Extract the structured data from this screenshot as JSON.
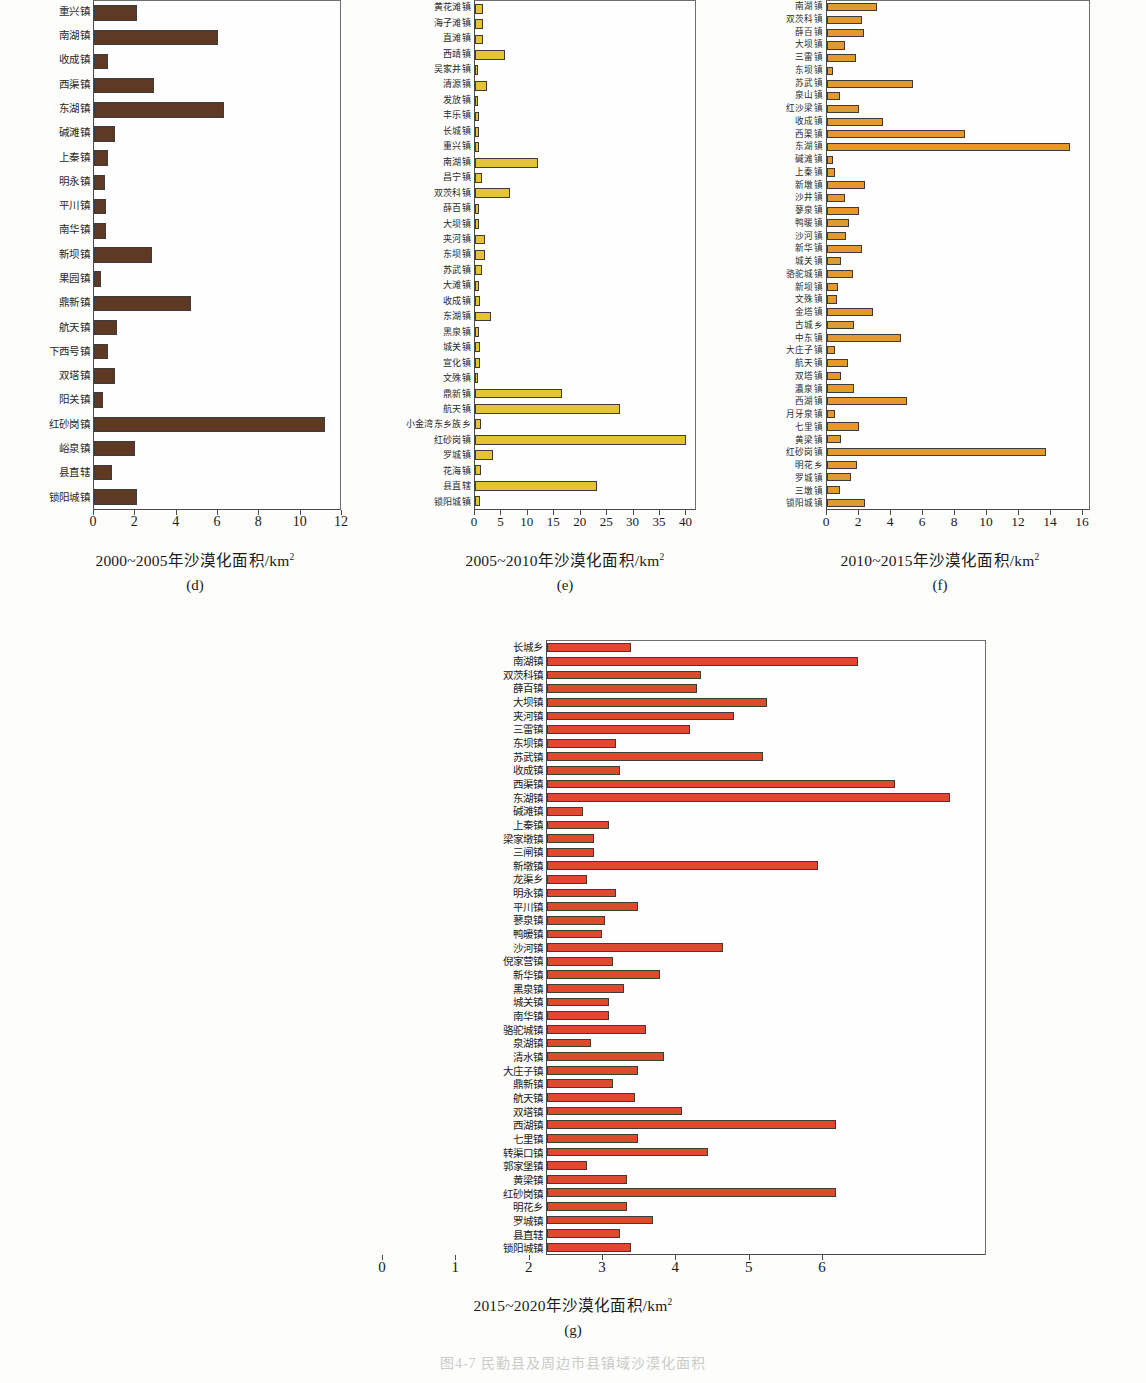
{
  "figure": {
    "bottom_caption": "图4-7 民勤县及周边市县镇域沙漠化面积"
  },
  "chart_data": [
    {
      "id": "d",
      "type": "bar",
      "orientation": "horizontal",
      "title": "",
      "xlabel": "2000~2005年沙漠化面积/km",
      "xlabel_sup": "2",
      "panel_label": "(d)",
      "ylabel": "",
      "xlim": [
        0,
        12
      ],
      "xticks": [
        0,
        2,
        4,
        6,
        8,
        10,
        12
      ],
      "grid": false,
      "color": "#5e3a25",
      "categories": [
        "重兴镇",
        "南湖镇",
        "收成镇",
        "西渠镇",
        "东湖镇",
        "碱滩镇",
        "上秦镇",
        "明永镇",
        "平川镇",
        "南华镇",
        "新坝镇",
        "果园镇",
        "鼎新镇",
        "航天镇",
        "下西号镇",
        "双塔镇",
        "阳关镇",
        "红砂岗镇",
        "峪泉镇",
        "县直辖",
        "锁阳城镇"
      ],
      "values": [
        2.1,
        6.0,
        0.7,
        2.9,
        6.3,
        1.0,
        0.7,
        0.55,
        0.6,
        0.6,
        2.8,
        0.35,
        4.7,
        1.1,
        0.7,
        1.0,
        0.45,
        11.2,
        2.0,
        0.85,
        2.1
      ]
    },
    {
      "id": "e",
      "type": "bar",
      "orientation": "horizontal",
      "title": "",
      "xlabel": "2005~2010年沙漠化面积/km",
      "xlabel_sup": "2",
      "panel_label": "(e)",
      "ylabel": "",
      "xlim": [
        0,
        42
      ],
      "xticks": [
        0,
        5,
        10,
        15,
        20,
        25,
        30,
        35,
        40
      ],
      "grid": false,
      "color": "#e5c433",
      "categories": [
        "黄花滩镇",
        "海子滩镇",
        "直滩镇",
        "西靖镇",
        "吴家井镇",
        "清源镇",
        "发放镇",
        "丰乐镇",
        "长城镇",
        "重兴镇",
        "南湖镇",
        "昌宁镇",
        "双茨科镇",
        "薛百镇",
        "大坝镇",
        "夹河镇",
        "东坝镇",
        "苏武镇",
        "大滩镇",
        "收成镇",
        "东湖镇",
        "黑泉镇",
        "城关镇",
        "宣化镇",
        "文殊镇",
        "鼎新镇",
        "航天镇",
        "小金湾东乡族乡",
        "红砂岗镇",
        "罗城镇",
        "花海镇",
        "县直辖",
        "锁阳城镇"
      ],
      "values": [
        1.6,
        1.6,
        1.6,
        5.6,
        0.5,
        2.3,
        0.6,
        0.7,
        0.7,
        0.7,
        12.0,
        1.4,
        6.6,
        0.7,
        0.8,
        1.9,
        1.9,
        1.3,
        0.7,
        1.0,
        3.0,
        0.8,
        1.0,
        1.0,
        0.5,
        16.5,
        27.5,
        1.1,
        40.0,
        3.4,
        1.2,
        23.0,
        0.9
      ]
    },
    {
      "id": "f",
      "type": "bar",
      "orientation": "horizontal",
      "title": "",
      "xlabel": "2010~2015年沙漠化面积/km",
      "xlabel_sup": "2",
      "panel_label": "(f)",
      "ylabel": "",
      "xlim": [
        0,
        16.5
      ],
      "xticks": [
        0,
        2,
        4,
        6,
        8,
        10,
        12,
        14,
        16
      ],
      "grid": false,
      "color": "#e3992e",
      "categories": [
        "南湖镇",
        "双茨科镇",
        "薛百镇",
        "大坝镇",
        "三雷镇",
        "东坝镇",
        "苏武镇",
        "泉山镇",
        "红沙梁镇",
        "收成镇",
        "西渠镇",
        "东湖镇",
        "碱滩镇",
        "上秦镇",
        "新墩镇",
        "沙井镇",
        "蓼泉镇",
        "鸭暖镇",
        "沙河镇",
        "新华镇",
        "城关镇",
        "骆驼城镇",
        "新坝镇",
        "文殊镇",
        "金塔镇",
        "古城乡",
        "中东镇",
        "大庄子镇",
        "航天镇",
        "双塔镇",
        "瀛泉镇",
        "西湖镇",
        "月牙泉镇",
        "七里镇",
        "黄梁镇",
        "红砂岗镇",
        "明花乡",
        "罗城镇",
        "三墩镇",
        "锁阳城镇"
      ],
      "values": [
        3.1,
        2.2,
        2.3,
        1.1,
        1.8,
        0.4,
        5.4,
        0.8,
        2.0,
        3.5,
        8.6,
        15.2,
        0.4,
        0.5,
        2.4,
        1.1,
        2.0,
        1.4,
        1.2,
        2.2,
        0.9,
        1.6,
        0.7,
        0.6,
        2.9,
        1.7,
        4.6,
        0.5,
        1.3,
        0.9,
        1.7,
        5.0,
        0.5,
        2.0,
        0.9,
        13.7,
        1.9,
        1.5,
        0.8,
        2.4
      ]
    },
    {
      "id": "g",
      "type": "bar",
      "orientation": "horizontal",
      "title": "",
      "xlabel": "2015~2020年沙漠化面积/km",
      "xlabel_sup": "2",
      "panel_label": "(g)",
      "ylabel": "",
      "xlim": [
        0,
        6
      ],
      "xticks": [
        0,
        1,
        2,
        3,
        4,
        5,
        6
      ],
      "grid": false,
      "color": "#df4a2c",
      "categories": [
        "长城乡",
        "南湖镇",
        "双茨科镇",
        "薛百镇",
        "大坝镇",
        "夹河镇",
        "三雷镇",
        "东坝镇",
        "苏武镇",
        "收成镇",
        "西渠镇",
        "东湖镇",
        "碱滩镇",
        "上秦镇",
        "梁家墩镇",
        "三闸镇",
        "新墩镇",
        "龙渠乡",
        "明永镇",
        "平川镇",
        "蓼泉镇",
        "鸭暖镇",
        "沙河镇",
        "倪家营镇",
        "新华镇",
        "黑泉镇",
        "城关镇",
        "南华镇",
        "骆驼城镇",
        "泉湖镇",
        "清水镇",
        "大庄子镇",
        "鼎新镇",
        "航天镇",
        "双塔镇",
        "西湖镇",
        "七里镇",
        "转渠口镇",
        "郭家堡镇",
        "黄梁镇",
        "红砂岗镇",
        "明花乡",
        "罗城镇",
        "县直辖",
        "锁阳城镇"
      ],
      "values": [
        1.15,
        4.25,
        2.1,
        2.05,
        3.0,
        2.55,
        1.95,
        0.95,
        2.95,
        1.0,
        4.75,
        5.5,
        0.5,
        0.85,
        0.65,
        0.65,
        3.7,
        0.55,
        0.95,
        1.25,
        0.8,
        0.75,
        2.4,
        0.9,
        1.55,
        1.05,
        0.85,
        0.85,
        1.35,
        0.6,
        1.6,
        1.25,
        0.9,
        1.2,
        1.85,
        3.95,
        1.25,
        2.2,
        0.55,
        1.1,
        3.95,
        1.1,
        1.45,
        1.0,
        1.15
      ]
    }
  ]
}
